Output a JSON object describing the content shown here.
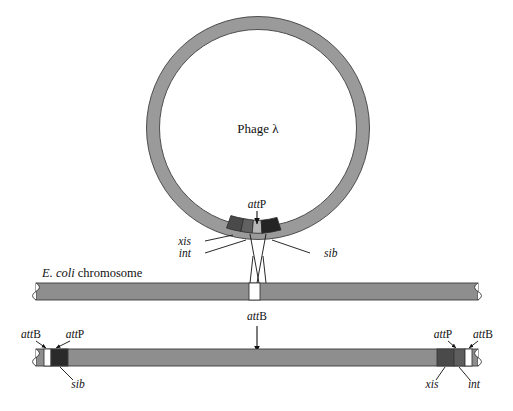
{
  "figure": {
    "title_text": "Phage λ",
    "chromosome_label_italic": "E. coli",
    "chromosome_label_rest": " chromosome",
    "colors": {
      "bar_gray": "#8e8e8e",
      "ring_gray": "#9a9a9a",
      "outline": "#3a3a3a",
      "segment_dark": "#2e2e2e",
      "segment_mid": "#5a5a5a",
      "segment_light": "#b4b4b4",
      "segment_white": "#ffffff",
      "text": "#111111"
    }
  },
  "circle": {
    "name": "Phage λ",
    "attp_label_italic": "att",
    "attp_label_rest": "P",
    "segments": [
      {
        "gene": "xis",
        "shade": "#4a4a4a"
      },
      {
        "gene": "int",
        "shade": "#5e5e5e"
      },
      {
        "gene": "attP",
        "shade": "#b4b4b4"
      },
      {
        "gene": "sib",
        "shade": "#222222"
      }
    ],
    "leader_labels": [
      {
        "text": "xis",
        "italic": true
      },
      {
        "text": "int",
        "italic": true
      },
      {
        "text": "sib",
        "italic": true
      }
    ]
  },
  "chromosome": {
    "label_italic": "E. coli",
    "label_rest": " chromosome",
    "attb_label_italic": "att",
    "attb_label_rest": "B",
    "site_color": "#ffffff"
  },
  "integrated": {
    "left_labels": [
      {
        "italic": "att",
        "rest": "B"
      },
      {
        "italic": "att",
        "rest": "P"
      }
    ],
    "right_labels": [
      {
        "italic": "att",
        "rest": "P"
      },
      {
        "italic": "att",
        "rest": "B"
      }
    ],
    "left_gene_label": "sib",
    "right_gene_labels": [
      "xis",
      "int"
    ],
    "left_segments": [
      {
        "gene": "attB",
        "shade": "#ffffff"
      },
      {
        "gene": "sib",
        "shade": "#2a2a2a"
      }
    ],
    "right_segments": [
      {
        "gene": "xis",
        "shade": "#4a4a4a"
      },
      {
        "gene": "int",
        "shade": "#5e5e5e"
      },
      {
        "gene": "attB",
        "shade": "#ffffff"
      }
    ]
  }
}
